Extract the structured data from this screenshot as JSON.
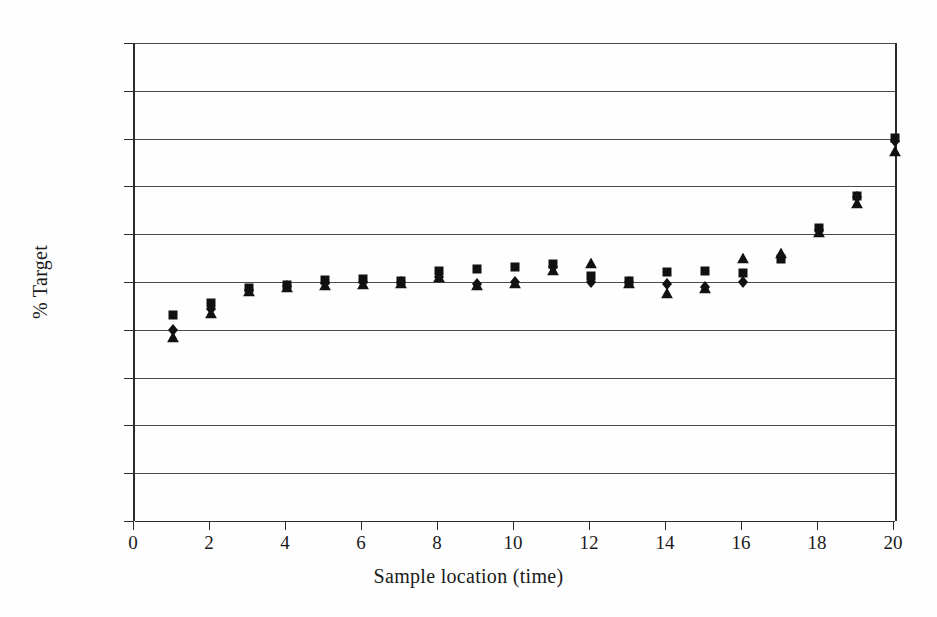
{
  "figure": {
    "background_color": "#fefefe",
    "ink_color": "#1a1a1a",
    "grid_color": "#4a4a4a",
    "frame_color": "#2b2b2b"
  },
  "axes": {
    "y_title": "% Target",
    "x_title": "Sample location (time)",
    "y_ticks": [
      "125.0",
      "120.0",
      "115.0",
      "110.0",
      "105.0",
      "100.0",
      "95.0",
      "90.0",
      "85.0",
      "80.0",
      "75.0"
    ],
    "x_ticks": [
      "0",
      "2",
      "4",
      "6",
      "8",
      "10",
      "12",
      "14",
      "16",
      "18",
      "20"
    ]
  },
  "chart_data": {
    "type": "scatter",
    "title": "",
    "xlabel": "Sample location (time)",
    "ylabel": "% Target",
    "xlim": [
      0,
      20
    ],
    "ylim": [
      75.0,
      125.0
    ],
    "xticks": [
      0,
      2,
      4,
      6,
      8,
      10,
      12,
      14,
      16,
      18,
      20
    ],
    "yticks": [
      75.0,
      80.0,
      85.0,
      90.0,
      95.0,
      100.0,
      105.0,
      110.0,
      115.0,
      120.0,
      125.0
    ],
    "grid": "horizontal",
    "legend": "none",
    "x": [
      1,
      2,
      3,
      4,
      5,
      6,
      7,
      8,
      9,
      10,
      11,
      12,
      13,
      14,
      15,
      16,
      17,
      18,
      19,
      20
    ],
    "series": [
      {
        "name": "Series 1",
        "marker": "square",
        "color": "#111111",
        "values": [
          96.5,
          97.8,
          99.4,
          99.7,
          100.2,
          100.3,
          100.1,
          101.1,
          101.4,
          101.6,
          101.9,
          100.6,
          100.1,
          101.0,
          101.2,
          100.9,
          102.4,
          105.6,
          109.0,
          115.1
        ]
      },
      {
        "name": "Series 2",
        "marker": "diamond",
        "color": "#111111",
        "values": [
          95.0,
          97.2,
          99.2,
          99.6,
          99.9,
          100.0,
          100.0,
          100.5,
          99.8,
          100.0,
          101.6,
          100.0,
          100.0,
          99.8,
          99.5,
          100.0,
          102.6,
          105.4,
          108.9,
          114.8
        ]
      },
      {
        "name": "Series 3",
        "marker": "triangle",
        "color": "#111111",
        "values": [
          94.2,
          96.8,
          99.1,
          99.5,
          99.7,
          99.8,
          99.9,
          100.5,
          99.7,
          99.9,
          101.3,
          102.0,
          99.9,
          98.8,
          99.4,
          102.5,
          103.0,
          105.2,
          108.3,
          113.7
        ]
      }
    ]
  }
}
